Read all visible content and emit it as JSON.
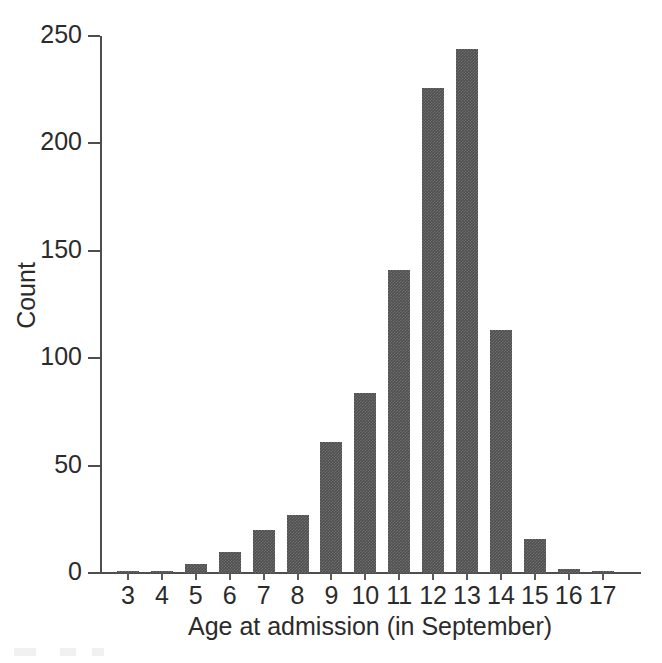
{
  "chart_data": {
    "type": "bar",
    "title": "",
    "subtitle": "",
    "xlabel": "Age at admission (in September)",
    "ylabel": "Count",
    "categories": [
      "3",
      "4",
      "5",
      "6",
      "7",
      "8",
      "9",
      "10",
      "11",
      "12",
      "13",
      "14",
      "15",
      "16",
      "17"
    ],
    "values": [
      1,
      1,
      4,
      10,
      20,
      27,
      61,
      84,
      141,
      226,
      244,
      113,
      16,
      2,
      1
    ],
    "series": [
      {
        "name": "Count",
        "values": [
          1,
          1,
          4,
          10,
          20,
          27,
          61,
          84,
          141,
          226,
          244,
          113,
          16,
          2,
          1
        ]
      }
    ],
    "ylim": [
      0,
      250
    ],
    "y_ticks": [
      0,
      50,
      100,
      150,
      200,
      250
    ],
    "y_tick_labels": [
      "0",
      "50",
      "100",
      "150",
      "200",
      "250"
    ],
    "x_tick_labels": [
      "3",
      "4",
      "5",
      "6",
      "7",
      "8",
      "9",
      "10",
      "11",
      "12",
      "13",
      "14",
      "15",
      "16",
      "17"
    ],
    "grid": false,
    "legend": false,
    "legend_position": "none",
    "bar_color": "#4f4f4f",
    "axis_color": "#4e4e4e",
    "text_color": "#2b2b2b",
    "background_color": "#ffffff"
  },
  "axes": {
    "y_title": "Count",
    "x_title": "Age at admission (in September)"
  }
}
